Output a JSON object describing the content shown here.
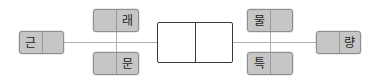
{
  "diagram": {
    "type": "linear-node-chain",
    "background_color": "#ffffff",
    "node_fill_color": "#c6c6c6",
    "node_border_color": "#8e8e8e",
    "center_node_fill_color": "#ffffff",
    "center_node_border_color": "#3a3a3a",
    "connector_color": "#b0b0b0",
    "nodes": [
      {
        "id": "node-geun",
        "position": "left",
        "left_cell": "근",
        "right_cell": "",
        "x": 19,
        "y": 31,
        "w": 45,
        "h": 23
      },
      {
        "id": "node-rae",
        "position": "top-left-branch",
        "left_cell": "",
        "right_cell": "래",
        "x": 93,
        "y": 9,
        "w": 46,
        "h": 23
      },
      {
        "id": "node-mun",
        "position": "bottom-left-branch",
        "left_cell": "",
        "right_cell": "문",
        "x": 93,
        "y": 52,
        "w": 46,
        "h": 23
      },
      {
        "id": "node-center",
        "position": "center",
        "left_cell": "",
        "right_cell": "",
        "x": 157,
        "y": 22,
        "w": 76,
        "h": 41
      },
      {
        "id": "node-mul",
        "position": "top-right-branch",
        "left_cell": "물",
        "right_cell": "",
        "x": 247,
        "y": 9,
        "w": 46,
        "h": 23
      },
      {
        "id": "node-teuk",
        "position": "bottom-right-branch",
        "left_cell": "특",
        "right_cell": "",
        "x": 247,
        "y": 52,
        "w": 46,
        "h": 23
      },
      {
        "id": "node-ryang",
        "position": "right",
        "left_cell": "",
        "right_cell": "량",
        "x": 316,
        "y": 31,
        "w": 45,
        "h": 23
      }
    ],
    "connectors": [
      {
        "id": "conn-geun-to-branch",
        "orientation": "horizontal",
        "x": 64,
        "y": 42,
        "length": 93
      },
      {
        "id": "conn-left-branch-vert",
        "orientation": "vertical",
        "x": 116,
        "y": 9,
        "length": 66
      },
      {
        "id": "conn-center-to-right",
        "orientation": "horizontal",
        "x": 233,
        "y": 42,
        "length": 83
      },
      {
        "id": "conn-right-branch-vert",
        "orientation": "vertical",
        "x": 270,
        "y": 9,
        "length": 66
      }
    ]
  }
}
